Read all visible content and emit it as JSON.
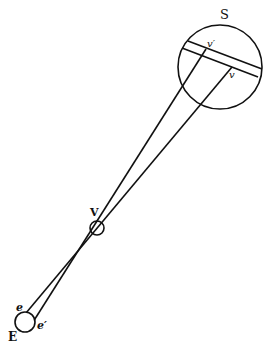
{
  "diagram": {
    "labels": {
      "sun": "S",
      "venus": "V",
      "earth": "E",
      "point_e": "e",
      "point_e_prime": "e′",
      "point_v": "v",
      "point_v_prime": "v′"
    },
    "colors": {
      "stroke": "#111111",
      "background": "#ffffff"
    }
  }
}
